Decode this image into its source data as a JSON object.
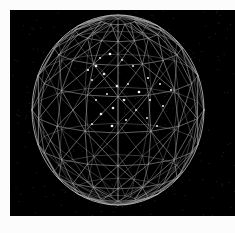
{
  "figure": {
    "render_style": "line-mesh",
    "background_color": "#000000",
    "page_color": "#fcfcfc",
    "line_color": "#9a9a9a",
    "back_line_color": "#6e6e6e",
    "silhouette_color": "#c8c8c8",
    "vertex_color": "#e8e8e8",
    "highlight_vertex_color": "#ffffff"
  },
  "canvas": {
    "left": 10,
    "top": 10,
    "width": 225,
    "height": 206
  },
  "chart_data": {
    "type": "scatter",
    "xlabel": "",
    "ylabel": "",
    "projection": "orthographic",
    "mesh": {
      "kind": "latitude-longitude-triangulated-sphere",
      "center_x": 118,
      "center_y": 110,
      "radius_x": 86,
      "radius_y": 95,
      "latitude_bands": 9,
      "longitude_segments": 16,
      "tilt_degrees": 14
    },
    "latitudes": [
      -78,
      -60,
      -42,
      -22,
      0,
      22,
      42,
      60,
      78
    ],
    "longitudes": [
      0,
      22.5,
      45,
      67.5,
      90,
      112.5,
      135,
      157.5,
      180,
      202.5,
      225,
      247.5,
      270,
      292.5,
      315,
      337.5
    ],
    "highlight_vertices": [
      {
        "x": 110,
        "y": 54
      },
      {
        "x": 100,
        "y": 58
      },
      {
        "x": 122,
        "y": 60
      },
      {
        "x": 96,
        "y": 66
      },
      {
        "x": 88,
        "y": 70
      },
      {
        "x": 133,
        "y": 66
      },
      {
        "x": 104,
        "y": 74
      },
      {
        "x": 92,
        "y": 80
      },
      {
        "x": 148,
        "y": 78
      },
      {
        "x": 117,
        "y": 86
      },
      {
        "x": 128,
        "y": 84
      },
      {
        "x": 160,
        "y": 84
      },
      {
        "x": 139,
        "y": 92
      },
      {
        "x": 107,
        "y": 94
      },
      {
        "x": 171,
        "y": 90
      },
      {
        "x": 124,
        "y": 100
      },
      {
        "x": 150,
        "y": 100
      },
      {
        "x": 96,
        "y": 100
      },
      {
        "x": 113,
        "y": 108
      },
      {
        "x": 136,
        "y": 110
      },
      {
        "x": 163,
        "y": 106
      },
      {
        "x": 101,
        "y": 114
      },
      {
        "x": 147,
        "y": 118
      },
      {
        "x": 126,
        "y": 120
      },
      {
        "x": 112,
        "y": 126
      },
      {
        "x": 157,
        "y": 126
      },
      {
        "x": 92,
        "y": 124
      }
    ]
  }
}
